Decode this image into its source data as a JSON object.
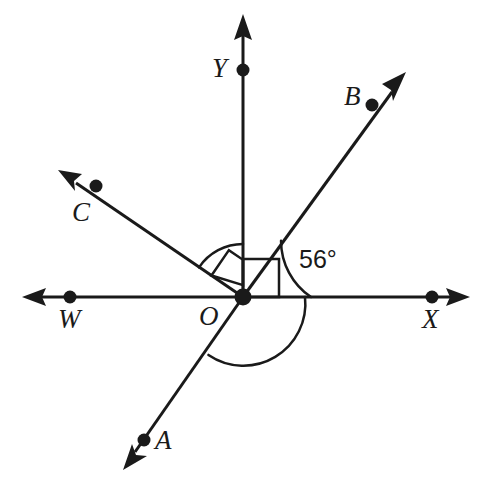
{
  "figure": {
    "canvas": {
      "width": 494,
      "height": 488
    },
    "stroke_color": "#1a1a1a",
    "background_color": "#ffffff",
    "origin": {
      "x": 243,
      "y": 297,
      "label": "O"
    },
    "points": [
      {
        "name": "Y",
        "label": "Y",
        "dot_x": 243,
        "dot_y": 70,
        "label_x": 212,
        "label_y": 55
      },
      {
        "name": "B",
        "label": "B",
        "dot_x": 372,
        "dot_y": 105,
        "label_x": 344,
        "label_y": 83
      },
      {
        "name": "C",
        "label": "C",
        "dot_x": 96,
        "dot_y": 186,
        "label_x": 72,
        "label_y": 199
      },
      {
        "name": "W",
        "label": "W",
        "dot_x": 70,
        "dot_y": 297,
        "label_x": 58,
        "label_y": 306
      },
      {
        "name": "X",
        "label": "X",
        "dot_x": 432,
        "dot_y": 297,
        "label_x": 422,
        "label_y": 306
      },
      {
        "name": "A",
        "label": "A",
        "dot_x": 144,
        "dot_y": 440,
        "label_x": 155,
        "label_y": 427
      },
      {
        "name": "O",
        "label": "O",
        "dot_x": 243,
        "dot_y": 297,
        "label_x": 199,
        "label_y": 303
      }
    ],
    "rays": [
      {
        "name": "ray-O-Y",
        "from": "O",
        "to": "Y",
        "angle_deg": 90,
        "arrow": true
      },
      {
        "name": "ray-O-B",
        "from": "O",
        "to": "B",
        "angle_deg": 56,
        "arrow": true
      },
      {
        "name": "ray-O-C",
        "from": "O",
        "to": "C",
        "angle_deg": 146,
        "arrow": true
      },
      {
        "name": "ray-O-W",
        "from": "O",
        "to": "W",
        "angle_deg": 180,
        "arrow": true
      },
      {
        "name": "ray-O-X",
        "from": "O",
        "to": "X",
        "angle_deg": 0,
        "arrow": true
      },
      {
        "name": "ray-O-A",
        "from": "O",
        "to": "A",
        "angle_deg": 236,
        "arrow": true
      }
    ],
    "angle_marks": [
      {
        "name": "angle-BOX",
        "label": "56°",
        "value": 56,
        "unit": "degrees",
        "label_x": 299,
        "label_y": 247,
        "type": "arc"
      },
      {
        "name": "angle-COY",
        "label": "",
        "type": "arc"
      },
      {
        "name": "angle-AOX",
        "label": "",
        "type": "arc"
      },
      {
        "name": "right-angle-COY",
        "label": "",
        "type": "square"
      },
      {
        "name": "right-angle-BOX",
        "label": "",
        "type": "square"
      }
    ]
  }
}
